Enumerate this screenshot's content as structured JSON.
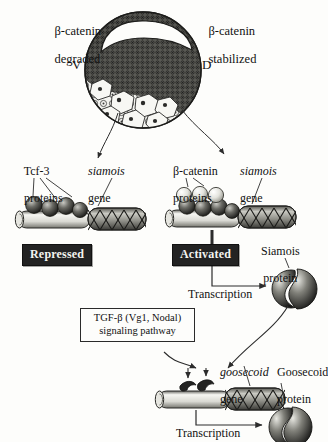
{
  "figure": {
    "type": "biological-pathway-diagram"
  },
  "embryo": {
    "name": "amphibian blastula cross-section",
    "left_label_line1": "β-catenin",
    "left_label_line2": "degraded",
    "right_label_line1": "β-catenin",
    "right_label_line2": "stabilized",
    "axis_ventral": "V",
    "axis_dorsal": "D"
  },
  "left_complex": {
    "protein_label_line1": "Tcf-3",
    "protein_label_line2": "proteins",
    "gene_label_line1": "siamois",
    "gene_label_line2": "gene",
    "state_badge": "Repressed"
  },
  "right_complex": {
    "protein_label_line1": "β-catenin",
    "protein_label_line2": "proteins",
    "gene_label_line1": "siamois",
    "gene_label_line2": "gene",
    "state_badge": "Activated",
    "transcription_label": "Transcription",
    "product_label_line1": "Siamois",
    "product_label_line2": "protein"
  },
  "signaling": {
    "box_line1": "TGF-β (Vg1, Nodal)",
    "box_line2": "signaling pathway"
  },
  "bottom_complex": {
    "gene_label_line1": "goosecoid",
    "gene_label_line2": "gene",
    "transcription_label": "Transcription",
    "product_label_line1": "Goosecoid",
    "product_label_line2": "protein"
  },
  "colors": {
    "ink": "#2c2c2c",
    "badge_bg": "#232323",
    "badge_text": "#f4f4f0",
    "paper": "#fdfdfb"
  }
}
